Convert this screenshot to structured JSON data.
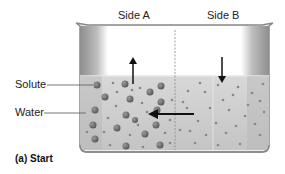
{
  "diagram": {
    "title_caption": "(a) Start",
    "side_labels": {
      "side_a": "Side A",
      "side_b": "Side B"
    },
    "callouts": [
      {
        "label": "Solute"
      },
      {
        "label": "Water"
      }
    ],
    "arrows": {
      "side_a_water_level": "up",
      "side_b_water_level": "down",
      "water_flow": "from Side B to Side A"
    },
    "colors": {
      "liquid": "#c8c8c8",
      "beaker_wall": "#9a9a9a",
      "solute_large": "#6e6e6e",
      "solute_small": "#7c7c7c",
      "arrow": "#111111"
    }
  }
}
